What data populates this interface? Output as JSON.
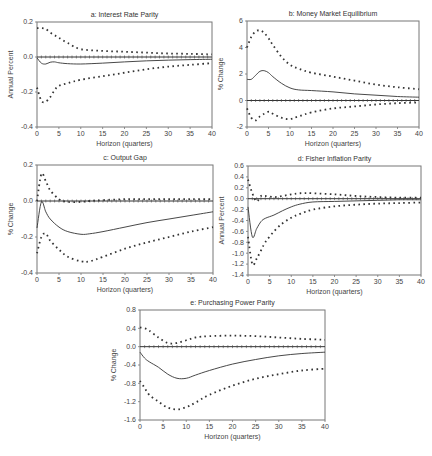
{
  "chart_data": [
    {
      "id": "a",
      "type": "line",
      "title": "a: Interest Rate Parity",
      "xlabel": "Horizon (quarters)",
      "ylabel": "Annual Percent",
      "xlim": [
        0,
        40
      ],
      "ylim": [
        -0.4,
        0.2
      ],
      "xticks": [
        0,
        5,
        10,
        15,
        20,
        25,
        30,
        35,
        40
      ],
      "yticks": [
        -0.4,
        -0.2,
        0.0,
        0.2
      ],
      "ytick_labels": [
        "-0.4",
        "-0.2",
        "0.0",
        "0.2"
      ],
      "box": [
        37,
        22,
        212,
        127
      ],
      "x": [
        0,
        1,
        2,
        3,
        4,
        5,
        7,
        10,
        15,
        20,
        25,
        30,
        35,
        40
      ],
      "series": [
        {
          "name": "response",
          "style": "solid",
          "values": [
            -0.005,
            -0.035,
            -0.04,
            -0.03,
            -0.028,
            -0.033,
            -0.038,
            -0.04,
            -0.035,
            -0.028,
            -0.022,
            -0.018,
            -0.015,
            -0.013
          ]
        },
        {
          "name": "upper band",
          "style": "dotted",
          "values": [
            0.165,
            0.165,
            0.16,
            0.14,
            0.125,
            0.11,
            0.08,
            0.045,
            0.035,
            0.03,
            0.025,
            0.02,
            0.018,
            0.015
          ]
        },
        {
          "name": "lower band",
          "style": "dotted",
          "values": [
            -0.175,
            -0.25,
            -0.255,
            -0.23,
            -0.19,
            -0.165,
            -0.15,
            -0.13,
            -0.11,
            -0.09,
            -0.07,
            -0.055,
            -0.045,
            -0.035
          ]
        }
      ]
    },
    {
      "id": "b",
      "type": "line",
      "title": "b: Money Market Equilibrium",
      "xlabel": "Horizon (quarters)",
      "ylabel": "% Change",
      "xlim": [
        0,
        40
      ],
      "ylim": [
        -2,
        6
      ],
      "xticks": [
        0,
        5,
        10,
        15,
        20,
        25,
        30,
        35,
        40
      ],
      "yticks": [
        -2,
        0,
        2,
        4,
        6
      ],
      "ytick_labels": [
        "-2",
        "0",
        "2",
        "4",
        "6"
      ],
      "box": [
        247,
        21,
        419,
        127
      ],
      "x": [
        0,
        1,
        2,
        3,
        4,
        5,
        6,
        8,
        10,
        12,
        15,
        20,
        25,
        30,
        35,
        40
      ],
      "series": [
        {
          "name": "response",
          "style": "solid",
          "values": [
            1.6,
            1.6,
            1.9,
            2.2,
            2.25,
            2.1,
            1.8,
            1.3,
            0.95,
            0.8,
            0.75,
            0.65,
            0.5,
            0.4,
            0.3,
            0.25
          ]
        },
        {
          "name": "upper band",
          "style": "dotted",
          "values": [
            4.0,
            4.8,
            5.2,
            5.3,
            5.1,
            4.7,
            4.2,
            3.3,
            2.7,
            2.4,
            2.1,
            1.8,
            1.5,
            1.2,
            1.0,
            0.85
          ]
        },
        {
          "name": "lower band",
          "style": "dotted",
          "values": [
            -0.6,
            -1.3,
            -1.5,
            -1.2,
            -1.0,
            -0.85,
            -1.0,
            -1.3,
            -1.4,
            -1.2,
            -0.9,
            -0.6,
            -0.45,
            -0.3,
            -0.2,
            -0.15
          ]
        }
      ]
    },
    {
      "id": "c",
      "type": "line",
      "title": "c: Output Gap",
      "xlabel": "Horizon (quarters)",
      "ylabel": "% Change",
      "xlim": [
        0,
        40
      ],
      "ylim": [
        -0.4,
        0.2
      ],
      "xticks": [
        0,
        5,
        10,
        15,
        20,
        25,
        30,
        35,
        40
      ],
      "yticks": [
        -0.4,
        -0.2,
        0.0,
        0.2
      ],
      "ytick_labels": [
        "-0.4",
        "-0.2",
        "0.0",
        "0.2"
      ],
      "box": [
        37,
        165,
        213,
        273
      ],
      "x": [
        0,
        1,
        2,
        3,
        5,
        7,
        10,
        12,
        15,
        20,
        25,
        30,
        35,
        40
      ],
      "series": [
        {
          "name": "response",
          "style": "solid",
          "values": [
            -0.15,
            -0.005,
            -0.06,
            -0.1,
            -0.145,
            -0.17,
            -0.185,
            -0.182,
            -0.17,
            -0.145,
            -0.12,
            -0.1,
            -0.08,
            -0.06
          ]
        },
        {
          "name": "upper band",
          "style": "dotted",
          "values": [
            0.0,
            0.15,
            0.11,
            0.06,
            0.01,
            -0.005,
            -0.005,
            0.0,
            0.005,
            0.01,
            0.01,
            0.01,
            0.01,
            0.01
          ]
        },
        {
          "name": "lower band",
          "style": "dotted",
          "values": [
            -0.29,
            -0.2,
            -0.18,
            -0.22,
            -0.27,
            -0.31,
            -0.335,
            -0.335,
            -0.31,
            -0.265,
            -0.23,
            -0.2,
            -0.17,
            -0.145
          ]
        }
      ]
    },
    {
      "id": "d",
      "type": "line",
      "title": "d: Fisher Inflation Parity",
      "xlabel": "Horizon (quarters)",
      "ylabel": "Annual Percent",
      "xlim": [
        0,
        40
      ],
      "ylim": [
        -1.4,
        0.6
      ],
      "xticks": [
        0,
        5,
        10,
        15,
        20,
        25,
        30,
        35,
        40
      ],
      "yticks": [
        -1.4,
        -1.2,
        -1.0,
        -0.8,
        -0.6,
        -0.4,
        -0.2,
        0.0,
        0.2,
        0.4,
        0.6
      ],
      "ytick_labels": [
        "-1.4",
        "-1.2",
        "-1.0",
        "-0.8",
        "-0.6",
        "-0.4",
        "-0.2",
        "0.0",
        "0.2",
        "0.4",
        "0.6"
      ],
      "box": [
        248,
        166,
        421,
        275
      ],
      "x": [
        0,
        1,
        2,
        3,
        4,
        6,
        8,
        10,
        12,
        15,
        20,
        25,
        30,
        35,
        40
      ],
      "series": [
        {
          "name": "response",
          "style": "solid",
          "values": [
            -0.15,
            -0.7,
            -0.55,
            -0.42,
            -0.36,
            -0.3,
            -0.22,
            -0.15,
            -0.1,
            -0.06,
            -0.05,
            -0.04,
            -0.03,
            -0.02,
            -0.02
          ]
        },
        {
          "name": "upper band",
          "style": "dotted",
          "values": [
            0.35,
            0.1,
            -0.05,
            0.05,
            0.05,
            0.03,
            0.05,
            0.08,
            0.1,
            0.1,
            0.08,
            0.05,
            0.03,
            0.02,
            0.02
          ]
        },
        {
          "name": "lower band",
          "style": "dotted",
          "values": [
            -0.7,
            -1.2,
            -1.1,
            -0.95,
            -0.8,
            -0.6,
            -0.45,
            -0.35,
            -0.28,
            -0.2,
            -0.14,
            -0.11,
            -0.09,
            -0.08,
            -0.07
          ]
        }
      ]
    },
    {
      "id": "e",
      "type": "line",
      "title": "e: Purchasing Power Parity",
      "xlabel": "Horizon (quarters)",
      "ylabel": "% Change",
      "xlim": [
        0,
        40
      ],
      "ylim": [
        -1.6,
        0.8
      ],
      "xticks": [
        0,
        5,
        10,
        15,
        20,
        25,
        30,
        35,
        40
      ],
      "yticks": [
        -1.6,
        -1.2,
        -0.8,
        -0.4,
        0.0,
        0.4,
        0.8
      ],
      "ytick_labels": [
        "-1.6",
        "-1.2",
        "-0.8",
        "-0.4",
        "0.0",
        "0.4",
        "0.8"
      ],
      "box": [
        140,
        310,
        325,
        420
      ],
      "x": [
        0,
        1,
        2,
        4,
        6,
        8,
        10,
        12,
        15,
        20,
        25,
        30,
        35,
        40
      ],
      "series": [
        {
          "name": "response",
          "style": "solid",
          "values": [
            -0.12,
            -0.25,
            -0.33,
            -0.45,
            -0.6,
            -0.69,
            -0.69,
            -0.62,
            -0.52,
            -0.38,
            -0.28,
            -0.2,
            -0.15,
            -0.12
          ]
        },
        {
          "name": "upper band",
          "style": "dotted",
          "values": [
            0.42,
            0.4,
            0.35,
            0.2,
            0.08,
            0.08,
            0.14,
            0.2,
            0.23,
            0.24,
            0.23,
            0.2,
            0.17,
            0.15
          ]
        },
        {
          "name": "lower band",
          "style": "dotted",
          "values": [
            -0.75,
            -0.9,
            -1.05,
            -1.2,
            -1.33,
            -1.37,
            -1.32,
            -1.22,
            -1.05,
            -0.85,
            -0.7,
            -0.6,
            -0.52,
            -0.48
          ]
        }
      ]
    }
  ]
}
